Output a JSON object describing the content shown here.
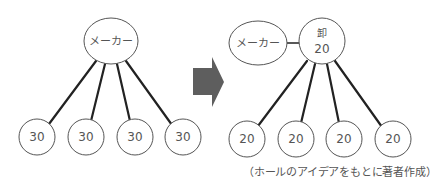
{
  "diagram": {
    "before": {
      "maker": {
        "label": "メーカー"
      },
      "retailers": [
        {
          "value": "30"
        },
        {
          "value": "30"
        },
        {
          "value": "30"
        },
        {
          "value": "30"
        }
      ]
    },
    "arrow": {
      "icon": "right-arrow-icon",
      "color": "#5e5e5e"
    },
    "after": {
      "maker": {
        "label": "メーカー"
      },
      "wholesaler": {
        "label": "卸",
        "value": "20"
      },
      "retailers": [
        {
          "value": "20"
        },
        {
          "value": "20"
        },
        {
          "value": "20"
        },
        {
          "value": "20"
        }
      ]
    },
    "caption": "（ホールのアイデアをもとに著者作成）"
  }
}
